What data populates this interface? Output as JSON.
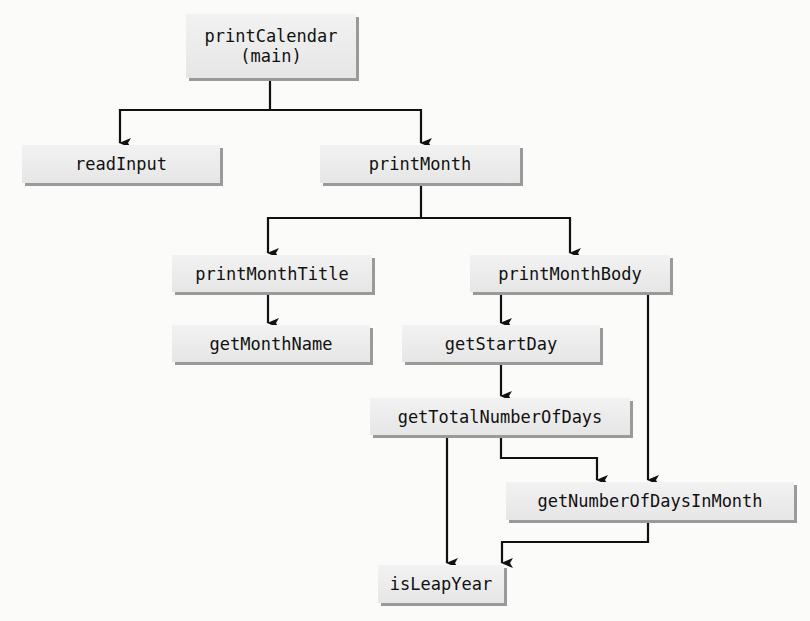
{
  "diagram": {
    "type": "call-hierarchy",
    "nodes": [
      {
        "id": "printCalendar",
        "label": "printCalendar\n(main)"
      },
      {
        "id": "readInput",
        "label": "readInput"
      },
      {
        "id": "printMonth",
        "label": "printMonth"
      },
      {
        "id": "printMonthTitle",
        "label": "printMonthTitle"
      },
      {
        "id": "printMonthBody",
        "label": "printMonthBody"
      },
      {
        "id": "getMonthName",
        "label": "getMonthName"
      },
      {
        "id": "getStartDay",
        "label": "getStartDay"
      },
      {
        "id": "getTotalNumberOfDays",
        "label": "getTotalNumberOfDays"
      },
      {
        "id": "getNumberOfDaysInMonth",
        "label": "getNumberOfDaysInMonth"
      },
      {
        "id": "isLeapYear",
        "label": "isLeapYear"
      }
    ],
    "edges": [
      {
        "from": "printCalendar",
        "to": "readInput"
      },
      {
        "from": "printCalendar",
        "to": "printMonth"
      },
      {
        "from": "printMonth",
        "to": "printMonthTitle"
      },
      {
        "from": "printMonth",
        "to": "printMonthBody"
      },
      {
        "from": "printMonthTitle",
        "to": "getMonthName"
      },
      {
        "from": "printMonthBody",
        "to": "getStartDay"
      },
      {
        "from": "printMonthBody",
        "to": "getNumberOfDaysInMonth"
      },
      {
        "from": "getStartDay",
        "to": "getTotalNumberOfDays"
      },
      {
        "from": "getTotalNumberOfDays",
        "to": "getNumberOfDaysInMonth"
      },
      {
        "from": "getTotalNumberOfDays",
        "to": "isLeapYear"
      },
      {
        "from": "getNumberOfDaysInMonth",
        "to": "isLeapYear"
      }
    ],
    "colors": {
      "box_fill": "#eaeaea",
      "box_shadow": "#9a9a9a",
      "line": "#111111",
      "text": "#111111"
    }
  }
}
